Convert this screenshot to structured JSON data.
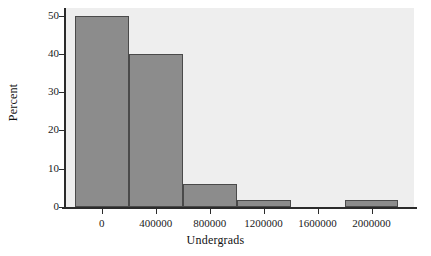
{
  "chart_data": {
    "type": "bar",
    "title": "",
    "xlabel": "Undergrads",
    "ylabel": "Percent",
    "xlim": [
      -265000,
      2315000
    ],
    "ylim": [
      0,
      52
    ],
    "grid": false,
    "legend": null,
    "bin_width": 400000,
    "categories": [
      "-200000 to 200000",
      "200000 to 600000",
      "600000 to 1000000",
      "1000000 to 1400000",
      "1400000 to 1800000",
      "1800000 to 2200000"
    ],
    "bin_starts": [
      -200000,
      200000,
      600000,
      1000000,
      1400000,
      1800000
    ],
    "values": [
      50,
      40,
      6,
      1.8,
      0,
      1.8
    ],
    "x_ticks": [
      0,
      400000,
      800000,
      1200000,
      1600000,
      2000000
    ],
    "x_tick_labels": [
      "0",
      "400000",
      "800000",
      "1200000",
      "1600000",
      "2000000"
    ],
    "y_ticks": [
      0,
      10,
      20,
      30,
      40,
      50
    ],
    "y_tick_labels": [
      "0",
      "10",
      "20",
      "30",
      "40",
      "50"
    ],
    "colors": {
      "bar_fill": "#8c8c8c",
      "bar_edge": "#4a4a4a",
      "panel_background": "#eeeeee",
      "figure_background": "#ffffff",
      "axis": "#2b2b2b",
      "text": "#1a1a1a"
    }
  }
}
